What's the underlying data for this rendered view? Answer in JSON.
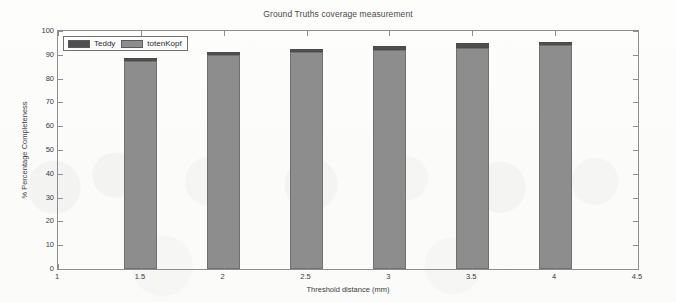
{
  "figure": {
    "title": "Ground Truths coverage measurement",
    "background_color": "#fdfdfc",
    "axis_color": "#8e8e8e"
  },
  "legend": {
    "position": "top-left-inside",
    "entries": [
      {
        "label": "Teddy",
        "color": "#4f4f4f",
        "swatch_name": "legend-swatch-teddy"
      },
      {
        "label": "totenKopf",
        "color": "#8d8d8d",
        "swatch_name": "legend-swatch-totenkopf"
      }
    ]
  },
  "chart_data": {
    "type": "bar",
    "title": "Ground Truths coverage measurement",
    "subtitle": "",
    "xlabel": "Threshold distance (mm)",
    "ylabel": "% Percentage Completeness",
    "categories": [
      1.5,
      2,
      2.5,
      3,
      3.5,
      4
    ],
    "category_labels": [
      "1.5",
      "2",
      "2.5",
      "3",
      "3.5",
      "4"
    ],
    "series": [
      {
        "name": "totenKopf",
        "color": "#8d8d8d",
        "values": [
          87.5,
          90.0,
          91.0,
          92.0,
          93.0,
          94.0
        ]
      },
      {
        "name": "Teddy",
        "color": "#4f4f4f",
        "values": [
          88.5,
          91.0,
          92.5,
          93.5,
          94.8,
          95.5
        ]
      }
    ],
    "stacked_overlay": true,
    "bar_tops": [
      88.5,
      91.0,
      92.5,
      93.5,
      94.8,
      95.5
    ],
    "xlim": [
      1,
      4.5
    ],
    "ylim": [
      0,
      100
    ],
    "xticks": [
      1,
      1.5,
      2,
      2.5,
      3,
      3.5,
      4,
      4.5
    ],
    "xtick_labels": [
      "1",
      "1.5",
      "2",
      "2.5",
      "3",
      "3.5",
      "4",
      "4.5"
    ],
    "yticks": [
      0,
      10,
      20,
      30,
      40,
      50,
      60,
      70,
      80,
      90,
      100
    ],
    "ytick_labels": [
      "0",
      "10",
      "20",
      "30",
      "40",
      "50",
      "60",
      "70",
      "80",
      "90",
      "100"
    ],
    "grid": false,
    "legend_position": "upper left",
    "bar_width_units": 0.2
  }
}
